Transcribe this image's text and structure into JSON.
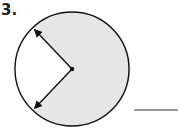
{
  "problem": {
    "number": "3.",
    "shape": "circle",
    "shaded_color": "#e6e6e6",
    "unshaded_sector": "white",
    "radii": 2,
    "answer_blank": ""
  }
}
